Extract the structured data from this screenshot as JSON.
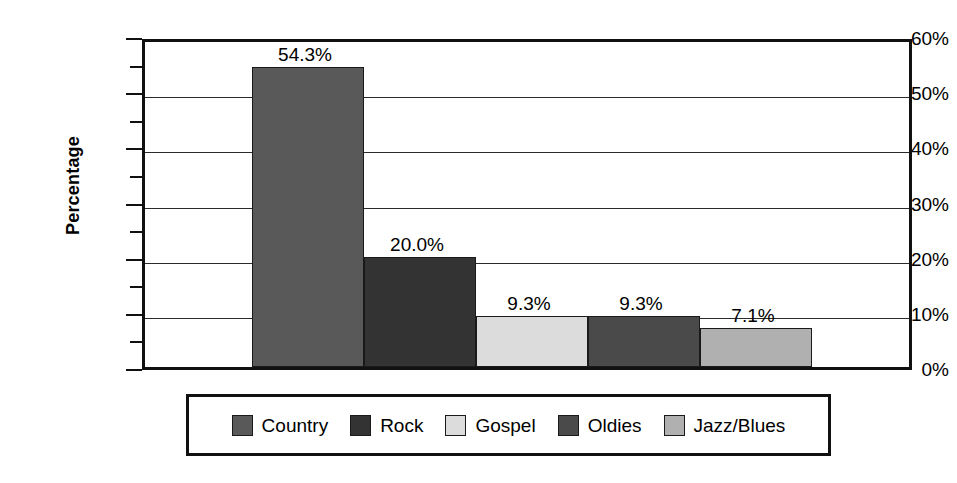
{
  "chart_data": {
    "type": "bar",
    "title": "",
    "subtitle": "",
    "xlabel": "",
    "ylabel": "Percentage",
    "categories": [
      "Country",
      "Rock",
      "Gospel",
      "Oldies",
      "Jazz/Blues"
    ],
    "values": [
      54.3,
      20.0,
      9.3,
      9.3,
      7.1
    ],
    "value_labels": [
      "54.3%",
      "20.0%",
      "9.3%",
      "9.3%",
      "7.1%"
    ],
    "series": [
      {
        "name": "Percentage",
        "values": [
          54.3,
          20.0,
          9.3,
          9.3,
          7.1
        ]
      }
    ],
    "colors": [
      "#595959",
      "#333333",
      "#dcdcdc",
      "#4a4a4a",
      "#b0b0b0"
    ],
    "ylim": [
      0,
      60
    ],
    "y_major_ticks": [
      0,
      10,
      20,
      30,
      40,
      50,
      60
    ],
    "y_major_tick_labels": [
      "0%",
      "10%",
      "20%",
      "30%",
      "40%",
      "50%",
      "60%"
    ],
    "y_minor_ticks": [
      5,
      15,
      25,
      35,
      45,
      55
    ],
    "grid": "horizontal-major",
    "legend_position": "bottom",
    "bar_gap": 0,
    "axis_color": "#111111",
    "gridline_color": "#2b2b2b",
    "background_color": "#ffffff"
  },
  "axis": {
    "y_title": "Percentage",
    "tick_labels": [
      "60%",
      "50%",
      "40%",
      "30%",
      "20%",
      "10%",
      "0%"
    ]
  },
  "bars": [
    {
      "category": "Country",
      "value": 54.3,
      "label": "54.3%",
      "color": "#595959"
    },
    {
      "category": "Rock",
      "value": 20.0,
      "label": "20.0%",
      "color": "#333333"
    },
    {
      "category": "Gospel",
      "value": 9.3,
      "label": "9.3%",
      "color": "#dcdcdc"
    },
    {
      "category": "Oldies",
      "value": 9.3,
      "label": "9.3%",
      "color": "#4a4a4a"
    },
    {
      "category": "Jazz/Blues",
      "value": 7.1,
      "label": "7.1%",
      "color": "#b0b0b0"
    }
  ],
  "legend": {
    "items": [
      {
        "label": "Country",
        "color": "#595959"
      },
      {
        "label": "Rock",
        "color": "#333333"
      },
      {
        "label": "Gospel",
        "color": "#dcdcdc"
      },
      {
        "label": "Oldies",
        "color": "#4a4a4a"
      },
      {
        "label": "Jazz/Blues",
        "color": "#b0b0b0"
      }
    ]
  }
}
